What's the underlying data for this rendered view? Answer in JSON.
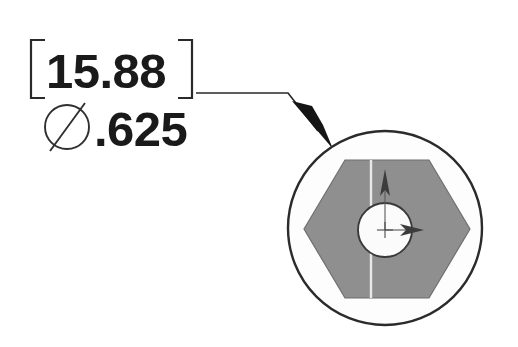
{
  "drawing": {
    "title": "Hex socket head fastener end view with bolt circle callout",
    "background_color": "#ffffff",
    "callout": {
      "basic_dimension": {
        "value": "15.88",
        "bracket_open": "[",
        "bracket_close": "]",
        "note": "bracketed basic metric dimension in millimeters"
      },
      "diameter_dimension": {
        "symbol": "Ø",
        "value": ".625",
        "full_text": "Ø.625",
        "note": "inch diameter callout"
      },
      "leader": {
        "type": "leader-line-with-arrowhead",
        "horizontal_start_x": 196,
        "horizontal_y": 93,
        "elbow_x": 288,
        "arrow_tip_x": 330,
        "arrow_tip_y": 145,
        "arrowhead_style": "filled-solid"
      }
    },
    "view": {
      "name": "end-view",
      "outer_circle": {
        "shape": "circle",
        "center_x": 385,
        "center_y": 228,
        "radius": 97,
        "fill_color": "#fdfdfd",
        "stroke_color": "#2b2b2b"
      },
      "hexagon": {
        "shape": "hexagon",
        "orientation": "flat-top",
        "center_x": 387,
        "center_y": 229,
        "width": 166,
        "height": 138,
        "fill_color": "#8f8f8f",
        "stroke_color": "#6f6f6f"
      },
      "bore": {
        "shape": "circle",
        "center_x": 385,
        "center_y": 230,
        "radius": 27,
        "fill_color": "#fbfbfb",
        "stroke_color": "#3a3a3a"
      },
      "centerline": {
        "type": "vertical",
        "x": 371,
        "color": "#e8e8e8"
      },
      "axis_markers": [
        {
          "name": "up-axis-arrow",
          "direction": "up",
          "color": "#3c3c3c"
        },
        {
          "name": "right-axis-arrow",
          "direction": "right",
          "color": "#3c3c3c"
        }
      ]
    }
  }
}
